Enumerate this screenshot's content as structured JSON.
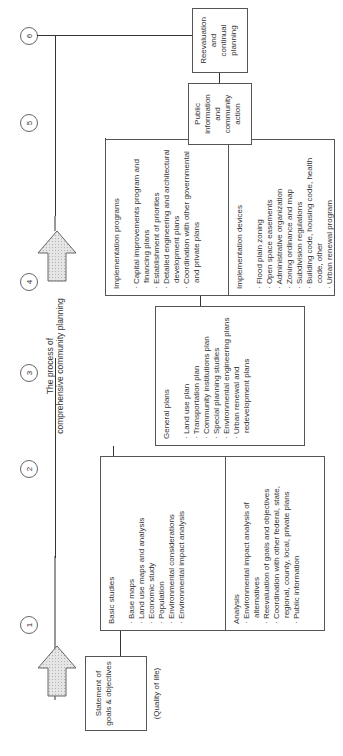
{
  "title": [
    "The process of",
    "comprehensive community planning"
  ],
  "steps": [
    "1",
    "2",
    "3",
    "4",
    "5",
    "6"
  ],
  "statement": {
    "line1": "Statement of",
    "line2": "goals & objectives",
    "line3": "(Quality of life)"
  },
  "basic_studies": {
    "heading": "Basic studies",
    "items": [
      "Base maps",
      "Land use maps and analysis",
      "Economic study",
      "Population",
      "Environmental considerations",
      "Environmental impact analysis"
    ]
  },
  "analysis": {
    "heading": "Analysis",
    "items": [
      "Environmental impact analysis of alternatives",
      "Reevaluation of goals and objectives",
      "Coordination with other federal, state, regional, county, local, private plans",
      "Public information"
    ]
  },
  "general_plans": {
    "heading": "General plans",
    "items": [
      "Land use plan",
      "Transportation plan",
      "Community institutions plan",
      "Special planning studies",
      "Environmental engineering plans",
      "Urban renewal and redevelopment plans"
    ]
  },
  "implementation_programs": {
    "heading": "Implementation programs",
    "items": [
      "Capital improvements program and financing plans",
      "Establishment of priorities",
      "Detailed engineering and architectural development plans",
      "Coordination with other governmental and private plans"
    ]
  },
  "implementation_devices": {
    "heading": "Implementation devices",
    "items": [
      "Flood plain zoning",
      "Open space easements",
      "Administrative organization",
      "Zoning ordinance and map",
      "Subdivision regulations",
      "Building code, housing code, health code, other",
      "Urban renewal program"
    ]
  },
  "public_info": [
    "Public",
    "information",
    "and",
    "community",
    "action"
  ],
  "reevaluation": [
    "Reevaluation",
    "and",
    "continual",
    "planning"
  ]
}
